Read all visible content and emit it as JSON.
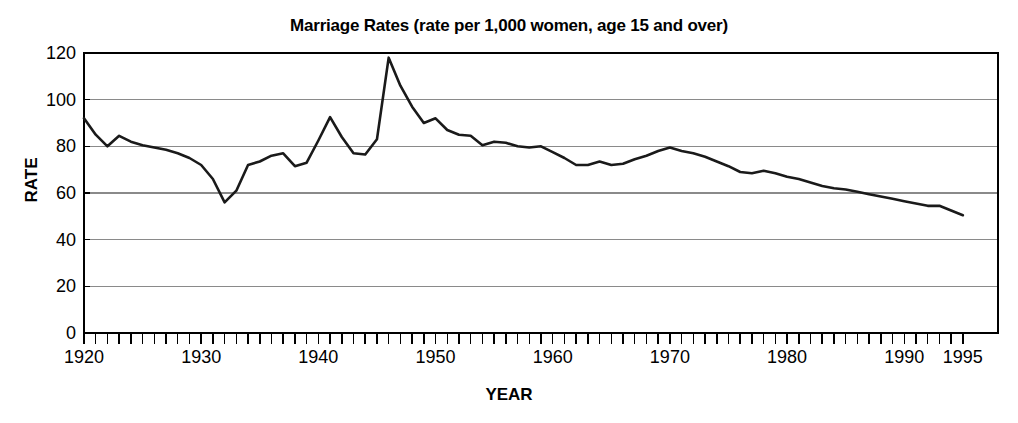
{
  "chart_data": {
    "type": "line",
    "title": "Marriage Rates (rate per 1,000 women, age 15 and over)",
    "xlabel": "YEAR",
    "ylabel": "RATE",
    "xlim": [
      1920,
      1998
    ],
    "ylim": [
      0,
      120
    ],
    "ytick_values": [
      0,
      20,
      40,
      60,
      80,
      100,
      120
    ],
    "ytick_labels": [
      "0",
      "20",
      "40",
      "60",
      "80",
      "100",
      "120"
    ],
    "xtick_labels": [
      "1920",
      "1930",
      "1940",
      "1950",
      "1960",
      "1970",
      "1980",
      "1990",
      "1995"
    ],
    "xtick_label_values": [
      1920,
      1930,
      1940,
      1950,
      1960,
      1970,
      1980,
      1990,
      1995
    ],
    "xminor_tick_step": 1,
    "xminor_tick_range": [
      1920,
      1995
    ],
    "grid": "horizontal",
    "legend": null,
    "line_color": "#1a1a1a",
    "grid_color": "#8a8a8a",
    "axis_color": "#000000",
    "background": "#ffffff",
    "series": [
      {
        "name": "Marriage rate",
        "x": [
          1920,
          1921,
          1922,
          1923,
          1924,
          1925,
          1926,
          1927,
          1928,
          1929,
          1930,
          1931,
          1932,
          1933,
          1934,
          1935,
          1936,
          1937,
          1938,
          1939,
          1940,
          1941,
          1942,
          1943,
          1944,
          1945,
          1946,
          1947,
          1948,
          1949,
          1950,
          1951,
          1952,
          1953,
          1954,
          1955,
          1956,
          1957,
          1958,
          1959,
          1960,
          1961,
          1962,
          1963,
          1964,
          1965,
          1966,
          1967,
          1968,
          1969,
          1970,
          1971,
          1972,
          1973,
          1974,
          1975,
          1976,
          1977,
          1978,
          1979,
          1980,
          1981,
          1982,
          1983,
          1984,
          1985,
          1986,
          1987,
          1988,
          1989,
          1990,
          1991,
          1992,
          1993,
          1994,
          1995
        ],
        "values": [
          92.0,
          85.0,
          80.0,
          84.5,
          82.0,
          80.5,
          79.5,
          78.5,
          77.0,
          75.0,
          72.0,
          66.0,
          56.0,
          61.0,
          72.0,
          73.5,
          76.0,
          77.0,
          71.5,
          73.0,
          82.5,
          92.5,
          84.0,
          77.0,
          76.5,
          83.0,
          118.0,
          106.0,
          97.0,
          90.0,
          92.0,
          87.0,
          85.0,
          84.5,
          80.5,
          82.0,
          81.5,
          80.0,
          79.5,
          80.0,
          77.5,
          75.0,
          72.0,
          72.0,
          73.5,
          72.0,
          72.5,
          74.5,
          76.0,
          78.0,
          79.5,
          78.0,
          77.0,
          75.5,
          73.5,
          71.5,
          69.0,
          68.5,
          69.5,
          68.5,
          67.0,
          66.0,
          64.5,
          63.0,
          62.0,
          61.5,
          60.5,
          59.5,
          58.5,
          57.5,
          56.5,
          55.5,
          54.5,
          54.5,
          52.5,
          50.5
        ]
      }
    ]
  }
}
